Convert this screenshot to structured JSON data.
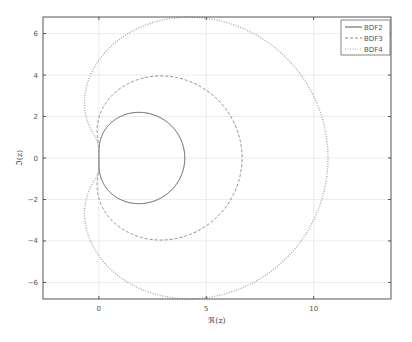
{
  "chart_data": {
    "type": "line",
    "title": "",
    "xlabel": "ℜ(z)",
    "ylabel": "ℑ(z)",
    "xlim": [
      -2.6,
      13.6
    ],
    "ylim": [
      -6.8,
      6.8
    ],
    "xticks": [
      0,
      5,
      10
    ],
    "yticks": [
      -6,
      -4,
      -2,
      0,
      2,
      4,
      6
    ],
    "grid": true,
    "legend_position": "upper right",
    "series": [
      {
        "name": "BDF2",
        "style": "solid",
        "color": "#555555",
        "order": 2,
        "description": "Stability boundary z = rho(e^{i theta})/sigma(e^{i theta}); circle centered (2,0), radius 2",
        "points": [
          [
            0,
            0
          ],
          [
            0.59,
            1.41
          ],
          [
            2,
            2
          ],
          [
            3.41,
            1.41
          ],
          [
            4,
            0
          ],
          [
            3.41,
            -1.41
          ],
          [
            2,
            -2
          ],
          [
            0.59,
            -1.41
          ]
        ]
      },
      {
        "name": "BDF3",
        "style": "dashed",
        "color": "#888888",
        "order": 3,
        "points": [
          [
            0,
            0
          ],
          [
            0.6,
            2.6
          ],
          [
            3.0,
            3.9
          ],
          [
            5.5,
            2.9
          ],
          [
            6.6,
            0
          ],
          [
            5.5,
            -2.9
          ],
          [
            3.0,
            -3.9
          ],
          [
            0.6,
            -2.6
          ]
        ]
      },
      {
        "name": "BDF4",
        "style": "dotted",
        "color": "#aaaaaa",
        "order": 4,
        "points": [
          [
            0,
            0
          ],
          [
            -0.8,
            1.6
          ],
          [
            -0.4,
            4.0
          ],
          [
            3.9,
            6.8
          ],
          [
            9.5,
            4.0
          ],
          [
            10.6,
            0
          ],
          [
            9.5,
            -4.0
          ],
          [
            3.9,
            -6.8
          ],
          [
            -0.4,
            -4.0
          ],
          [
            -0.8,
            -1.6
          ]
        ]
      }
    ]
  },
  "legend": {
    "items": [
      {
        "label": "BDF2"
      },
      {
        "label": "BDF3"
      },
      {
        "label": "BDF4"
      }
    ]
  },
  "axes": {
    "xlabel": "ℜ(z)",
    "ylabel": "ℑ(z)",
    "xtick_labels": [
      "0",
      "5",
      "10"
    ],
    "ytick_labels": [
      "6",
      "4",
      "2",
      "0",
      "−2",
      "−4",
      "−6"
    ]
  }
}
